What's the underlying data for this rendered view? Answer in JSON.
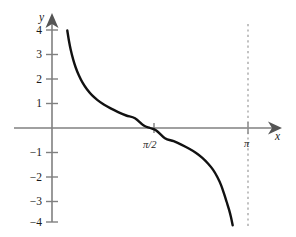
{
  "figure": {
    "background_color": "#ffffff",
    "axis_color": "#808080",
    "curve_color": "#111111",
    "asymptote_color": "#999999"
  },
  "axes": {
    "x_label": "x",
    "y_label": "y"
  },
  "chart_data": {
    "type": "line",
    "title": "",
    "subtitle": "",
    "xlabel": "x",
    "ylabel": "y",
    "function": "y = cot(x)",
    "xlim": [
      -0.22,
      3.72
    ],
    "ylim": [
      -4.6,
      4.6
    ],
    "grid": false,
    "legend": false,
    "legend_position": "none",
    "x_tick_labels": [
      "π/2",
      "π"
    ],
    "x_tick_values": [
      1.5708,
      3.1416
    ],
    "y_tick_labels": [
      "4",
      "3",
      "2",
      "1",
      "−1",
      "−2",
      "−3",
      "−4"
    ],
    "y_tick_values": [
      4,
      3,
      2,
      1,
      -1,
      -2,
      -3,
      -4
    ],
    "annotations": [
      {
        "text": "π/2",
        "x": 1.5708,
        "y": -0.55,
        "note": "x-axis tick label below zero crossing"
      },
      {
        "text": "π",
        "x": 3.1416,
        "y": -0.62,
        "note": "x-axis tick label at vertical asymptote"
      }
    ],
    "asymptotes": [
      {
        "type": "vertical",
        "x": 3.1416,
        "style": "dashed",
        "label": "π"
      }
    ],
    "series": [
      {
        "name": "y = cot(x)",
        "style": "solid",
        "width": 2.4,
        "color": "#111111",
        "x": [
          0.245,
          0.27,
          0.3,
          0.34,
          0.38,
          0.43,
          0.49,
          0.56,
          0.64,
          0.73,
          0.83,
          0.94,
          1.06,
          1.19,
          1.33,
          1.4708,
          1.5708,
          1.6708,
          1.81,
          1.95,
          2.08,
          2.2,
          2.31,
          2.41,
          2.5,
          2.58,
          2.65,
          2.71,
          2.76,
          2.8,
          2.84,
          2.87,
          2.896
        ],
        "y": [
          3.98,
          3.58,
          3.19,
          2.79,
          2.47,
          2.15,
          1.85,
          1.58,
          1.34,
          1.14,
          0.96,
          0.8,
          0.65,
          0.51,
          0.4,
          0.1,
          0.0,
          -0.1,
          -0.42,
          -0.54,
          -0.69,
          -0.85,
          -1.02,
          -1.22,
          -1.45,
          -1.7,
          -2.0,
          -2.33,
          -2.7,
          -3.02,
          -3.35,
          -3.65,
          -3.97
        ]
      }
    ]
  }
}
